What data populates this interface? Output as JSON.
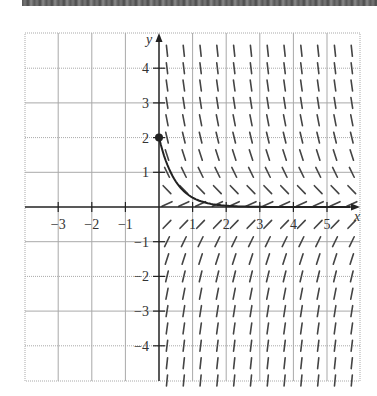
{
  "figure": {
    "title": "",
    "banner_color": "#5a5a5a",
    "axis_labels": {
      "x": "x",
      "y": "y"
    },
    "x_ticks": [
      {
        "value": -3,
        "label": "−3"
      },
      {
        "value": -2,
        "label": "−2"
      },
      {
        "value": -1,
        "label": "−1"
      },
      {
        "value": 1,
        "label": "1"
      },
      {
        "value": 2,
        "label": "2"
      },
      {
        "value": 3,
        "label": "3"
      },
      {
        "value": 4,
        "label": "4"
      },
      {
        "value": 5,
        "label": "5"
      }
    ],
    "y_ticks": [
      {
        "value": 4,
        "label": "4"
      },
      {
        "value": 3,
        "label": "3"
      },
      {
        "value": 2,
        "label": "2"
      },
      {
        "value": 1,
        "label": "1"
      },
      {
        "value": -1,
        "label": "−1"
      },
      {
        "value": -2,
        "label": "−2"
      },
      {
        "value": -3,
        "label": "−3"
      },
      {
        "value": -4,
        "label": "−4"
      }
    ],
    "xlim": [
      -4,
      6
    ],
    "ylim": [
      -5,
      5
    ],
    "grid": true,
    "grid_color": "#a9a9a9",
    "axis_color": "#222222",
    "slope_field": {
      "equation": "dy/dx = -2y",
      "x_start": 0,
      "x_end": 5.5,
      "x_step": 0.5,
      "y_start": -5,
      "y_end": 4.5,
      "y_step": 0.5,
      "zero_row_slope": 0.45,
      "segment_color": "#444444"
    },
    "solution_curve": {
      "equation": "y = 2e^(-2x)",
      "initial_point": {
        "x": 0,
        "y": 2
      },
      "x_range": [
        0,
        6
      ],
      "color": "#222222"
    }
  }
}
